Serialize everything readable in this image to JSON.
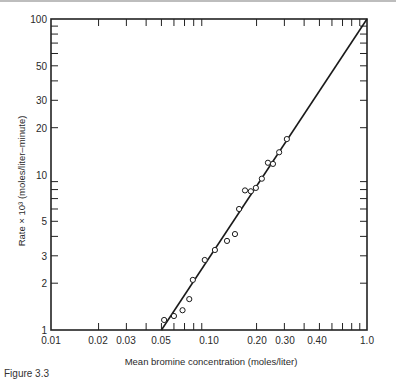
{
  "chart_data": {
    "type": "scatter",
    "title": "",
    "xlabel": "Mean bromine concentration (moles/liter)",
    "ylabel": "Rate × 10³ (moles/liter–minute)",
    "xscale": "log",
    "yscale": "log",
    "xlim": [
      0.01,
      1.0
    ],
    "ylim": [
      1,
      100
    ],
    "grid": false,
    "legend": null,
    "x_tick_labels": [
      {
        "value": 0.01,
        "label": "0.01"
      },
      {
        "value": 0.02,
        "label": "0.02"
      },
      {
        "value": 0.03,
        "label": "0.03"
      },
      {
        "value": 0.05,
        "label": "0.05"
      },
      {
        "value": 0.1,
        "label": "0.10"
      },
      {
        "value": 0.2,
        "label": "0.20"
      },
      {
        "value": 0.3,
        "label": "0.30"
      },
      {
        "value": 0.45,
        "label": "0.40"
      },
      {
        "value": 1.0,
        "label": "1.0"
      }
    ],
    "y_tick_labels": [
      {
        "value": 1,
        "label": "1"
      },
      {
        "value": 2,
        "label": "2"
      },
      {
        "value": 3,
        "label": "3"
      },
      {
        "value": 5,
        "label": "5"
      },
      {
        "value": 10,
        "label": "10"
      },
      {
        "value": 20,
        "label": "20"
      },
      {
        "value": 30,
        "label": "30"
      },
      {
        "value": 50,
        "label": "50"
      },
      {
        "value": 100,
        "label": "100"
      }
    ],
    "series": [
      {
        "name": "observed",
        "marker": "open-circle",
        "points": [
          [
            0.052,
            1.16
          ],
          [
            0.06,
            1.23
          ],
          [
            0.068,
            1.34
          ],
          [
            0.075,
            1.58
          ],
          [
            0.079,
            2.1
          ],
          [
            0.094,
            2.82
          ],
          [
            0.109,
            3.27
          ],
          [
            0.13,
            3.74
          ],
          [
            0.146,
            4.14
          ],
          [
            0.155,
            6.0
          ],
          [
            0.169,
            7.9
          ],
          [
            0.184,
            7.8
          ],
          [
            0.198,
            8.2
          ],
          [
            0.216,
            9.4
          ],
          [
            0.236,
            11.9
          ],
          [
            0.254,
            11.7
          ],
          [
            0.278,
            13.9
          ],
          [
            0.311,
            16.9
          ]
        ]
      },
      {
        "name": "fit line",
        "type": "line",
        "points": [
          [
            0.05,
            1
          ],
          [
            1.0,
            100
          ]
        ]
      }
    ]
  },
  "caption": "Figure 3.3"
}
